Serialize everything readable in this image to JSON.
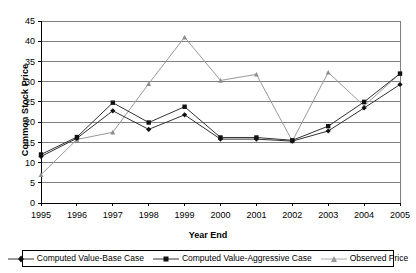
{
  "chart_data": {
    "type": "line",
    "title": "",
    "xlabel": "Year End",
    "ylabel": "Common Stock Price",
    "x": [
      1995,
      1996,
      1997,
      1998,
      1999,
      2000,
      2001,
      2002,
      2003,
      2004,
      2005
    ],
    "categories": [
      "1995",
      "1996",
      "1997",
      "1998",
      "1999",
      "2000",
      "2001",
      "2002",
      "2003",
      "2004",
      "2005"
    ],
    "xlim": [
      1995,
      2005
    ],
    "ylim": [
      0,
      45
    ],
    "yticks": [
      0,
      5,
      10,
      15,
      20,
      25,
      30,
      35,
      40,
      45
    ],
    "ytick_labels": [
      "0",
      "5",
      "10",
      "15",
      "20",
      "25",
      "30",
      "35",
      "40",
      "45"
    ],
    "xtick_labels": [
      "1995",
      "1996",
      "1997",
      "1998",
      "1999",
      "2000",
      "2001",
      "2002",
      "2003",
      "2004",
      "2005"
    ],
    "grid": "horizontal",
    "legend_position": "bottom",
    "series": [
      {
        "name": "Computed Value-Base Case",
        "marker": "diamond",
        "color": "#333333",
        "values": [
          11.5,
          16.0,
          22.8,
          18.2,
          21.8,
          15.8,
          15.8,
          15.3,
          17.8,
          23.5,
          29.3
        ]
      },
      {
        "name": "Computed Value-Aggressive Case",
        "marker": "square",
        "color": "#333333",
        "values": [
          12.0,
          16.3,
          24.8,
          19.9,
          23.8,
          16.2,
          16.2,
          15.5,
          19.0,
          25.0,
          32.0
        ]
      },
      {
        "name": "Observed Price",
        "marker": "triangle",
        "color": "#999999",
        "values": [
          7.0,
          15.7,
          17.5,
          29.5,
          41.0,
          30.3,
          31.8,
          15.3,
          32.3,
          24.0,
          32.0
        ]
      }
    ]
  },
  "axes": {
    "y_title": "Common Stock Price",
    "x_title": "Year End"
  },
  "legend": {
    "entries": [
      {
        "label": "Computed Value-Base Case",
        "marker": "diamond-marker",
        "color": "#333333"
      },
      {
        "label": "Computed Value-Aggressive Case",
        "marker": "square-marker",
        "color": "#333333"
      },
      {
        "label": "Observed Price",
        "marker": "triangle-marker",
        "color": "#999999"
      }
    ]
  },
  "colors": {
    "plot_border": "#000000",
    "gridline": "#808080",
    "background": "#ffffff",
    "series_dark": "#333333",
    "series_light": "#999999"
  }
}
